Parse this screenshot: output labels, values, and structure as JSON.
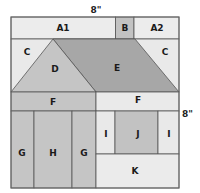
{
  "diagram": {
    "dimensions": {
      "top": "8\"",
      "right": "8\""
    },
    "colors": {
      "light": "#ebebeb",
      "medium": "#c6c6c6",
      "dark": "#a9a9a9",
      "line": "#555555"
    },
    "pieces": [
      {
        "id": "A1",
        "label": "A1"
      },
      {
        "id": "B",
        "label": "B"
      },
      {
        "id": "A2",
        "label": "A2"
      },
      {
        "id": "C-left",
        "label": "C"
      },
      {
        "id": "C-right",
        "label": "C"
      },
      {
        "id": "D",
        "label": "D"
      },
      {
        "id": "E",
        "label": "E"
      },
      {
        "id": "F-left",
        "label": "F"
      },
      {
        "id": "F-right",
        "label": "F"
      },
      {
        "id": "G-left",
        "label": "G"
      },
      {
        "id": "H",
        "label": "H"
      },
      {
        "id": "G-right",
        "label": "G"
      },
      {
        "id": "I-left",
        "label": "I"
      },
      {
        "id": "J",
        "label": "J"
      },
      {
        "id": "I-right",
        "label": "I"
      },
      {
        "id": "K",
        "label": "K"
      }
    ]
  }
}
